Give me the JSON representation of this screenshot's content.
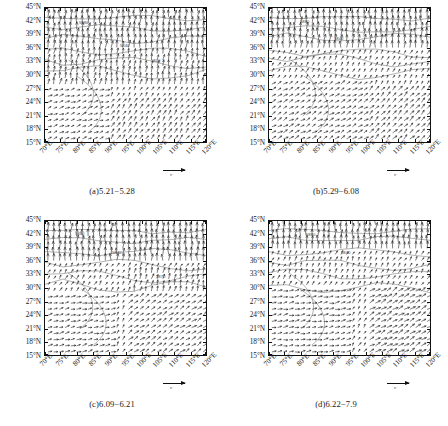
{
  "figure": {
    "background": "#ffffff",
    "line_color": "#111111"
  },
  "axes": {
    "y_ticks": [
      "45°N",
      "42°N",
      "39°N",
      "36°N",
      "33°N",
      "30°N",
      "27°N",
      "24°N",
      "21°N",
      "18°N",
      "15°N"
    ],
    "y_values": [
      45,
      42,
      39,
      36,
      33,
      30,
      27,
      24,
      21,
      18,
      15
    ],
    "x_ticks": [
      "70°E",
      "75°E",
      "80°E",
      "85°E",
      "90°E",
      "95°E",
      "100°E",
      "105°E",
      "110°E",
      "115°E",
      "120°E"
    ],
    "x_values": [
      70,
      75,
      80,
      85,
      90,
      95,
      100,
      105,
      110,
      115,
      120
    ],
    "xlim": [
      70,
      120
    ],
    "ylim": [
      15,
      45
    ]
  },
  "vector_key": {
    "label": "v"
  },
  "panels": [
    {
      "id": "a",
      "caption": "(a)5.21−5.28"
    },
    {
      "id": "b",
      "caption": "(b)5.29−6.08"
    },
    {
      "id": "c",
      "caption": "(c)6.09−6.21"
    },
    {
      "id": "d",
      "caption": "(d)6.22−7.9"
    }
  ],
  "chart_data": {
    "type": "scatter",
    "title": "",
    "xlabel": "",
    "ylabel": "",
    "xlim": [
      70,
      120
    ],
    "ylim": [
      15,
      45
    ],
    "grid": false,
    "legend": "none",
    "panels": [
      {
        "id": "a",
        "label": "(a)5.21−5.28",
        "regions": [
          {
            "name": "northern-westerlies",
            "lat_range": [
              36,
              45
            ],
            "lon_range": [
              70,
              120
            ],
            "direction_deg": 85,
            "speed": 1.0
          },
          {
            "name": "mid-latitude-westerly",
            "lat_range": [
              27,
              36
            ],
            "lon_range": [
              70,
              120
            ],
            "direction_deg": 80,
            "speed": 0.75
          },
          {
            "name": "south-asia-cyclonic",
            "lat_range": [
              15,
              27
            ],
            "lon_range": [
              70,
              90
            ],
            "direction_deg": 20,
            "speed": 0.4
          },
          {
            "name": "bay-of-bengal-southwesterly",
            "lat_range": [
              15,
              25
            ],
            "lon_range": [
              90,
              120
            ],
            "direction_deg": 55,
            "speed": 0.55
          }
        ],
        "contour_labels": [
          "5880",
          "5840",
          "5800"
        ]
      },
      {
        "id": "b",
        "label": "(b)5.29−6.08",
        "regions": [
          {
            "name": "northern-westerlies",
            "lat_range": [
              36,
              45
            ],
            "lon_range": [
              70,
              120
            ],
            "direction_deg": 88,
            "speed": 1.0
          },
          {
            "name": "plateau-weak-flow",
            "lat_range": [
              30,
              36
            ],
            "lon_range": [
              75,
              95
            ],
            "direction_deg": 60,
            "speed": 0.35
          },
          {
            "name": "southwest-monsoon",
            "lat_range": [
              15,
              28
            ],
            "lon_range": [
              70,
              100
            ],
            "direction_deg": 30,
            "speed": 0.5
          },
          {
            "name": "south-china-sea-southerly",
            "lat_range": [
              15,
              27
            ],
            "lon_range": [
              100,
              120
            ],
            "direction_deg": 45,
            "speed": 0.6
          }
        ],
        "contour_labels": [
          "5880",
          "5840"
        ]
      },
      {
        "id": "c",
        "label": "(c)6.09−6.21",
        "regions": [
          {
            "name": "northern-westerlies",
            "lat_range": [
              36,
              45
            ],
            "lon_range": [
              70,
              120
            ],
            "direction_deg": 88,
            "speed": 1.0
          },
          {
            "name": "subtropical-high-ridge",
            "lat_range": [
              28,
              34
            ],
            "lon_range": [
              95,
              120
            ],
            "direction_deg": 75,
            "speed": 0.6
          },
          {
            "name": "arabian-sea-monsoon",
            "lat_range": [
              15,
              28
            ],
            "lon_range": [
              70,
              92
            ],
            "direction_deg": 15,
            "speed": 0.45
          },
          {
            "name": "east-asia-southerly",
            "lat_range": [
              15,
              28
            ],
            "lon_range": [
              95,
              120
            ],
            "direction_deg": 35,
            "speed": 0.55
          }
        ],
        "contour_labels": [
          "5880",
          "5840",
          "5870"
        ]
      },
      {
        "id": "d",
        "label": "(d)6.22−7.9",
        "regions": [
          {
            "name": "northern-westerlies",
            "lat_range": [
              38,
              45
            ],
            "lon_range": [
              70,
              120
            ],
            "direction_deg": 88,
            "speed": 1.0
          },
          {
            "name": "plateau-anticyclone",
            "lat_range": [
              31,
              37
            ],
            "lon_range": [
              75,
              100
            ],
            "direction_deg": 70,
            "speed": 0.4
          },
          {
            "name": "india-monsoon-trough",
            "lat_range": [
              15,
              30
            ],
            "lon_range": [
              70,
              95
            ],
            "direction_deg": 10,
            "speed": 0.45
          },
          {
            "name": "western-pacific-southerly",
            "lat_range": [
              15,
              30
            ],
            "lon_range": [
              100,
              120
            ],
            "direction_deg": 30,
            "speed": 0.7
          }
        ],
        "contour_labels": [
          "5880",
          "5840"
        ]
      }
    ]
  }
}
